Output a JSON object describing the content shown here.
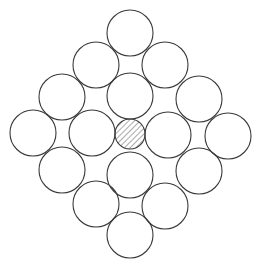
{
  "diagram": {
    "type": "circle-packing",
    "stroke_color": "#3a3a3a",
    "fill_color": "#ffffff",
    "hatch_color": "#555555",
    "large_radius": 23,
    "small_radius": 15,
    "circles": [
      {
        "cx": 130,
        "cy": 33
      },
      {
        "cx": 96,
        "cy": 65
      },
      {
        "cx": 165,
        "cy": 65
      },
      {
        "cx": 62,
        "cy": 97
      },
      {
        "cx": 130,
        "cy": 96
      },
      {
        "cx": 199,
        "cy": 99
      },
      {
        "cx": 33,
        "cy": 133
      },
      {
        "cx": 92,
        "cy": 133
      },
      {
        "cx": 168,
        "cy": 135
      },
      {
        "cx": 228,
        "cy": 136
      },
      {
        "cx": 62,
        "cy": 170
      },
      {
        "cx": 130,
        "cy": 175
      },
      {
        "cx": 199,
        "cy": 171
      },
      {
        "cx": 96,
        "cy": 204
      },
      {
        "cx": 165,
        "cy": 206
      },
      {
        "cx": 130,
        "cy": 235
      }
    ],
    "center_circle": {
      "cx": 130,
      "cy": 134,
      "r": 15,
      "pattern": "diagonal-hatch"
    }
  }
}
